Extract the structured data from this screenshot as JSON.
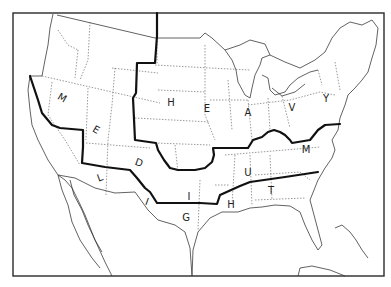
{
  "map": {
    "title": "",
    "region": "Contiguous United States",
    "zones": [
      {
        "name": "HEAVY",
        "letters": [
          "H",
          "E",
          "A",
          "V",
          "Y"
        ]
      },
      {
        "name": "MEDIUM",
        "letters": [
          "M",
          "E",
          "D",
          "I",
          "U",
          "M"
        ]
      },
      {
        "name": "LIGHT",
        "letters": [
          "L",
          "I",
          "G",
          "H",
          "T"
        ]
      }
    ],
    "labels": [
      {
        "char": "H",
        "x": 171,
        "y": 103,
        "rot": 0
      },
      {
        "char": "E",
        "x": 207,
        "y": 109,
        "rot": 0
      },
      {
        "char": "A",
        "x": 248,
        "y": 113,
        "rot": 0
      },
      {
        "char": "V",
        "x": 292,
        "y": 108,
        "rot": 0
      },
      {
        "char": "Y",
        "x": 326,
        "y": 99,
        "rot": 0
      },
      {
        "char": "M",
        "x": 62,
        "y": 98,
        "rot": 30
      },
      {
        "char": "E",
        "x": 96,
        "y": 130,
        "rot": 30
      },
      {
        "char": "D",
        "x": 139,
        "y": 163,
        "rot": 20
      },
      {
        "char": "I",
        "x": 189,
        "y": 197,
        "rot": 0
      },
      {
        "char": "U",
        "x": 248,
        "y": 173,
        "rot": 0
      },
      {
        "char": "M",
        "x": 306,
        "y": 150,
        "rot": 0
      },
      {
        "char": "L",
        "x": 100,
        "y": 178,
        "rot": -20
      },
      {
        "char": "I",
        "x": 147,
        "y": 202,
        "rot": 20
      },
      {
        "char": "G",
        "x": 186,
        "y": 218,
        "rot": 0
      },
      {
        "char": "H",
        "x": 231,
        "y": 205,
        "rot": 0
      },
      {
        "char": "T",
        "x": 271,
        "y": 191,
        "rot": 0
      }
    ],
    "colors": {
      "ink": "#111111",
      "background": "#ffffff"
    }
  }
}
